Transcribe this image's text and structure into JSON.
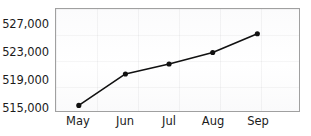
{
  "chart_data": {
    "type": "line",
    "title": "",
    "subtitle": "",
    "xlabel": "",
    "ylabel": "",
    "categories": [
      "May",
      "Jun",
      "Jul",
      "Aug",
      "Sep"
    ],
    "values": [
      515700,
      519650,
      520900,
      522350,
      524700
    ],
    "series": [
      {
        "name": "",
        "values": [
          515700,
          519650,
          520900,
          522350,
          524700
        ]
      }
    ],
    "ylim": [
      515000,
      527800
    ],
    "yticks": [
      515000,
      519000,
      523000,
      527000
    ],
    "ytick_labels": [
      "515,000",
      "519,000",
      "523,000",
      "527,000"
    ],
    "xtick_labels": [
      "May",
      "Jun",
      "Jul",
      "Aug",
      "Sep"
    ],
    "grid": true,
    "legend": false,
    "legend_position": "none",
    "line_color": "#111111",
    "marker_color": "#111111",
    "marker": "circle",
    "plot_border_color": "#a0a0a0",
    "plot_background_color": "#fdfdfd",
    "text_color": "#1b1b1b"
  }
}
